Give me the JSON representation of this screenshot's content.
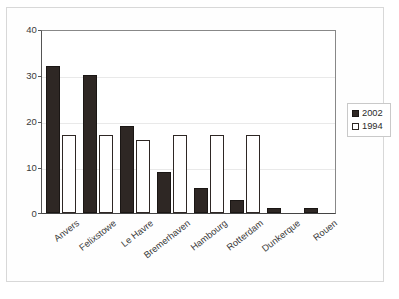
{
  "chart_data": {
    "type": "bar",
    "title": "",
    "subtitle": "",
    "xlabel": "",
    "ylabel": "",
    "ylim": [
      0,
      40
    ],
    "yticks": [
      0,
      10,
      20,
      30,
      40
    ],
    "grid": true,
    "legend_position": "right",
    "categories": [
      "Anvers",
      "Felixstowe",
      "Le Havre",
      "Bremerhaven",
      "Hambourg",
      "Rotterdam",
      "Dunkerque",
      "Rouen"
    ],
    "series": [
      {
        "name": "2002",
        "color": "#2e2724",
        "values": [
          32,
          30,
          19,
          9,
          5.5,
          2.8,
          1,
          1
        ]
      },
      {
        "name": "1994",
        "color": "#ffffff",
        "values": [
          17,
          17,
          15.8,
          17,
          17,
          17,
          0,
          0
        ]
      }
    ]
  },
  "legend": {
    "items": [
      {
        "label": "2002",
        "swatch": "filled-black-square"
      },
      {
        "label": "1994",
        "swatch": "white-square-outline"
      }
    ]
  },
  "axis": {
    "y_tick_labels": [
      "0",
      "10",
      "20",
      "30",
      "40"
    ]
  }
}
